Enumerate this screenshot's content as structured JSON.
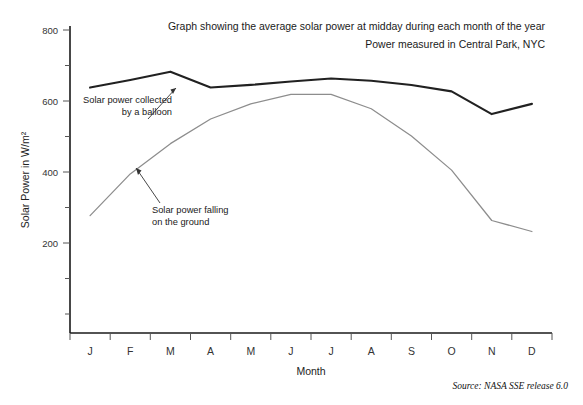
{
  "chart_data": {
    "type": "line",
    "title": "Graph showing the average solar power at midday during each month of the year",
    "subtitle": "Power measured in Central Park, NYC",
    "xlabel": "Month",
    "ylabel": "Solar Power in W/m²",
    "categories": [
      "J",
      "F",
      "M",
      "A",
      "M",
      "J",
      "J",
      "A",
      "S",
      "O",
      "N",
      "D"
    ],
    "ylim": [
      0,
      800
    ],
    "yticks_major": [
      200,
      400,
      600,
      800
    ],
    "yticks_minor": [
      100,
      300,
      500,
      700
    ],
    "grid": false,
    "legend": "none",
    "series": [
      {
        "name": "Solar power collected by a balloon",
        "color": "#212121",
        "values": [
          648,
          668,
          690,
          648,
          655,
          664,
          672,
          666,
          655,
          638,
          578,
          605
        ]
      },
      {
        "name": "Solar power falling on the ground",
        "color": "#8d8d8d",
        "values": [
          310,
          420,
          500,
          565,
          605,
          630,
          630,
          592,
          520,
          430,
          297,
          268
        ]
      }
    ],
    "annotations": [
      {
        "id": "annotation-balloon",
        "line1": "Solar power collected",
        "line2": "by a balloon",
        "target_month": "M",
        "target_value": 672
      },
      {
        "id": "annotation-ground",
        "line1": "Solar power falling",
        "line2": "on the ground",
        "target_month": "F",
        "target_value": 455
      }
    ],
    "source": "Source: NASA SSE release 6.0",
    "source_prefix": "Source: ",
    "source_name": "NASA SSE",
    "source_suffix": " release 6.0"
  }
}
